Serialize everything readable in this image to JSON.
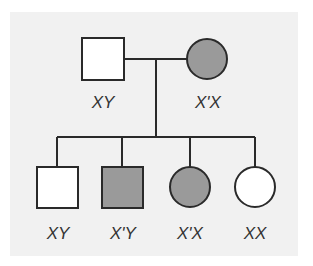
{
  "diagram": {
    "type": "pedigree",
    "colors": {
      "background": "#f1f1f1",
      "line": "#2a2a2a",
      "affected_fill": "#9a9a9a",
      "unaffected_fill": "#ffffff"
    },
    "generation1": {
      "father": {
        "shape": "square",
        "affected": false,
        "genotype": "XY"
      },
      "mother": {
        "shape": "circle",
        "affected": true,
        "genotype": "X'X"
      }
    },
    "generation2": [
      {
        "shape": "square",
        "affected": false,
        "genotype": "XY"
      },
      {
        "shape": "square",
        "affected": true,
        "genotype": "X'Y"
      },
      {
        "shape": "circle",
        "affected": true,
        "genotype": "X'X"
      },
      {
        "shape": "circle",
        "affected": false,
        "genotype": "XX"
      }
    ]
  }
}
